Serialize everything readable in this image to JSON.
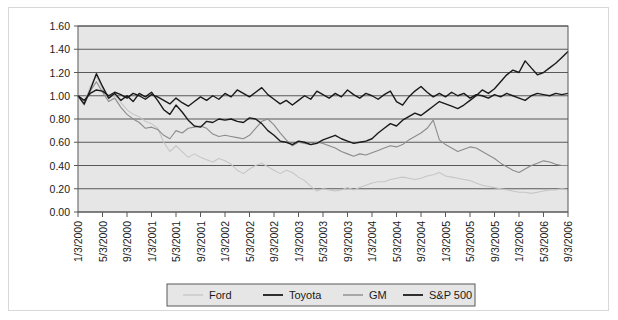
{
  "chart_data": {
    "type": "line",
    "title": "",
    "xlabel": "",
    "ylabel": "",
    "ylim": [
      0.0,
      1.6
    ],
    "yticks": [
      "0.00",
      "0.20",
      "0.40",
      "0.60",
      "0.80",
      "1.00",
      "1.20",
      "1.40",
      "1.60"
    ],
    "grid": true,
    "legend_position": "bottom",
    "plot_background": "#e6e6e6",
    "xtick_labels": [
      "1/3/2000",
      "5/3/2000",
      "9/3/2000",
      "1/3/2001",
      "5/3/2001",
      "9/3/2001",
      "1/3/2002",
      "5/3/2002",
      "9/3/2002",
      "1/3/2003",
      "5/3/2003",
      "9/3/2003",
      "1/3/2004",
      "5/3/2004",
      "9/3/2004",
      "1/3/2005",
      "5/3/2005",
      "9/3/2005",
      "1/3/2006",
      "5/3/2006",
      "9/3/2006"
    ],
    "series": [
      {
        "name": "Ford",
        "color": "#c6c6c6",
        "values": [
          1.0,
          0.93,
          1.08,
          1.17,
          1.06,
          0.97,
          1.01,
          0.94,
          0.88,
          0.84,
          0.82,
          0.78,
          0.76,
          0.72,
          0.6,
          0.52,
          0.57,
          0.52,
          0.47,
          0.5,
          0.47,
          0.45,
          0.43,
          0.46,
          0.44,
          0.41,
          0.36,
          0.33,
          0.37,
          0.4,
          0.42,
          0.39,
          0.36,
          0.33,
          0.36,
          0.34,
          0.3,
          0.27,
          0.22,
          0.18,
          0.2,
          0.19,
          0.18,
          0.19,
          0.21,
          0.19,
          0.21,
          0.23,
          0.25,
          0.26,
          0.26,
          0.28,
          0.29,
          0.3,
          0.29,
          0.28,
          0.29,
          0.31,
          0.32,
          0.34,
          0.31,
          0.3,
          0.29,
          0.28,
          0.27,
          0.25,
          0.23,
          0.22,
          0.21,
          0.2,
          0.19,
          0.18,
          0.17,
          0.17,
          0.16,
          0.17,
          0.18,
          0.19,
          0.19,
          0.2,
          0.19
        ]
      },
      {
        "name": "Toyota",
        "color": "#1a1a1a",
        "values": [
          1.0,
          0.93,
          1.05,
          1.19,
          1.08,
          0.98,
          1.02,
          0.96,
          1.0,
          0.95,
          1.02,
          0.99,
          1.03,
          0.96,
          0.88,
          0.84,
          0.92,
          0.86,
          0.79,
          0.74,
          0.73,
          0.78,
          0.77,
          0.8,
          0.79,
          0.8,
          0.78,
          0.77,
          0.81,
          0.8,
          0.76,
          0.7,
          0.66,
          0.61,
          0.6,
          0.58,
          0.61,
          0.6,
          0.58,
          0.59,
          0.62,
          0.64,
          0.66,
          0.63,
          0.61,
          0.59,
          0.6,
          0.61,
          0.63,
          0.68,
          0.72,
          0.76,
          0.74,
          0.79,
          0.82,
          0.85,
          0.83,
          0.87,
          0.91,
          0.95,
          0.93,
          0.91,
          0.89,
          0.92,
          0.96,
          1.0,
          1.05,
          1.02,
          1.06,
          1.12,
          1.18,
          1.22,
          1.2,
          1.3,
          1.24,
          1.18,
          1.2,
          1.24,
          1.28,
          1.33,
          1.38
        ]
      },
      {
        "name": "GM",
        "color": "#8c8c8c",
        "values": [
          1.0,
          0.92,
          1.04,
          1.12,
          1.03,
          0.95,
          0.98,
          0.9,
          0.84,
          0.8,
          0.77,
          0.72,
          0.73,
          0.71,
          0.66,
          0.63,
          0.7,
          0.68,
          0.72,
          0.73,
          0.74,
          0.72,
          0.67,
          0.65,
          0.66,
          0.65,
          0.64,
          0.63,
          0.66,
          0.72,
          0.78,
          0.8,
          0.75,
          0.68,
          0.62,
          0.57,
          0.6,
          0.59,
          0.58,
          0.6,
          0.59,
          0.57,
          0.55,
          0.52,
          0.5,
          0.48,
          0.5,
          0.49,
          0.51,
          0.53,
          0.55,
          0.57,
          0.56,
          0.58,
          0.62,
          0.65,
          0.68,
          0.72,
          0.79,
          0.62,
          0.58,
          0.55,
          0.52,
          0.54,
          0.56,
          0.55,
          0.52,
          0.49,
          0.46,
          0.42,
          0.39,
          0.36,
          0.34,
          0.37,
          0.4,
          0.42,
          0.44,
          0.43,
          0.41,
          0.4,
          0.4
        ]
      },
      {
        "name": "S&P 500",
        "color": "#1a1a1a",
        "values": [
          1.0,
          0.96,
          1.02,
          1.05,
          1.04,
          1.0,
          1.03,
          1.01,
          0.98,
          1.02,
          1.0,
          0.97,
          1.01,
          0.99,
          0.96,
          0.93,
          0.98,
          0.94,
          0.91,
          0.95,
          0.99,
          0.96,
          1.0,
          0.97,
          1.02,
          0.99,
          1.05,
          1.02,
          0.99,
          1.03,
          1.07,
          1.01,
          0.97,
          0.93,
          0.96,
          0.92,
          0.96,
          1.0,
          0.97,
          1.04,
          1.01,
          0.98,
          1.02,
          0.99,
          1.05,
          1.01,
          0.98,
          1.02,
          1.0,
          0.97,
          1.01,
          1.04,
          0.95,
          0.92,
          0.99,
          1.04,
          1.08,
          1.03,
          0.99,
          1.02,
          0.99,
          1.03,
          1.0,
          1.02,
          0.98,
          1.01,
          1.0,
          0.98,
          1.01,
          0.99,
          1.02,
          1.0,
          0.98,
          0.96,
          1.0,
          1.02,
          1.01,
          1.0,
          1.02,
          1.01,
          1.02
        ]
      }
    ]
  },
  "legend": {
    "items": [
      {
        "label": "Ford",
        "color": "#c6c6c6"
      },
      {
        "label": "Toyota",
        "color": "#1a1a1a"
      },
      {
        "label": "GM",
        "color": "#8c8c8c"
      },
      {
        "label": "S&P 500",
        "color": "#1a1a1a"
      }
    ]
  }
}
